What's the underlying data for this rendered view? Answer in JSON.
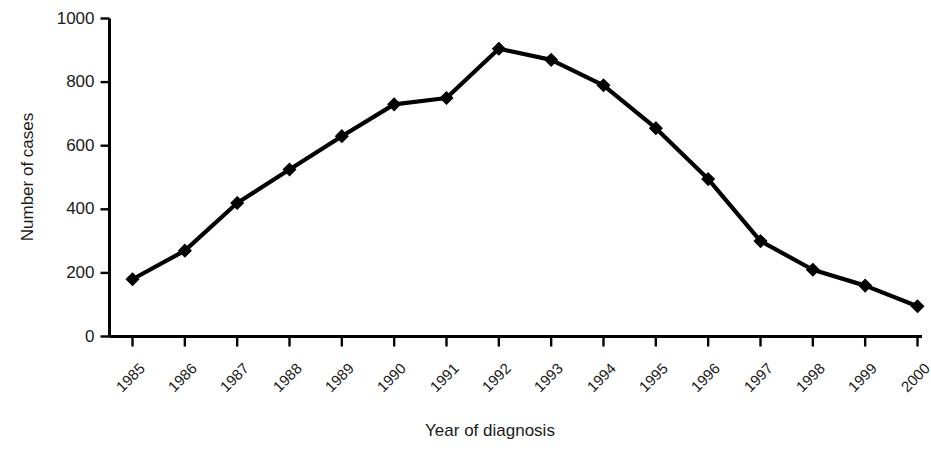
{
  "chart_data": {
    "type": "line",
    "title": "",
    "xlabel": "Year of diagnosis",
    "ylabel": "Number of cases",
    "categories": [
      "1985",
      "1986",
      "1987",
      "1988",
      "1989",
      "1990",
      "1991",
      "1992",
      "1993",
      "1994",
      "1995",
      "1996",
      "1997",
      "1998",
      "1999",
      "2000"
    ],
    "values": [
      180,
      270,
      420,
      525,
      630,
      730,
      750,
      905,
      870,
      790,
      655,
      495,
      300,
      210,
      160,
      95
    ],
    "ylim": [
      0,
      1000
    ],
    "y_ticks": [
      0,
      200,
      400,
      600,
      800,
      1000
    ],
    "y_tick_labels": [
      "0",
      "200",
      "400",
      "600",
      "800",
      "1000"
    ],
    "grid": false,
    "legend": "none",
    "series": [
      {
        "name": "Number of cases",
        "values": [
          180,
          270,
          420,
          525,
          630,
          730,
          750,
          905,
          870,
          790,
          655,
          495,
          300,
          210,
          160,
          95
        ]
      }
    ],
    "marker": "diamond",
    "line_color": "#000000",
    "marker_color": "#000000"
  },
  "axes": {
    "y_title": "Number of cases",
    "x_title": "Year of diagnosis"
  }
}
